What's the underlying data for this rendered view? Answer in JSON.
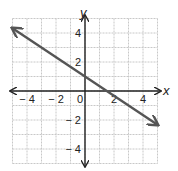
{
  "chart_data": {
    "type": "line",
    "title": "",
    "xlabel": "x",
    "ylabel": "y",
    "xlim": [
      -5,
      5
    ],
    "ylim": [
      -5,
      5
    ],
    "grid": true,
    "x_tick_labels": [
      "− 4",
      "− 2",
      "0",
      "2",
      "4"
    ],
    "x_tick_values": [
      -4,
      -2,
      0,
      2,
      4
    ],
    "y_tick_labels": [
      "4",
      "2",
      "− 2",
      "− 4"
    ],
    "y_tick_values": [
      4,
      2,
      -2,
      -4
    ],
    "series": [
      {
        "name": "line",
        "equation": "y = -2/3 x + 1",
        "slope": -0.6667,
        "intercept": 1,
        "x": [
          -5,
          5
        ],
        "y": [
          4.33,
          -2.33
        ],
        "arrows_both_ends": true,
        "color": "#555555"
      }
    ]
  },
  "colors": {
    "grid": "#c8c8c8",
    "axes": "#222222",
    "line": "#555555"
  }
}
